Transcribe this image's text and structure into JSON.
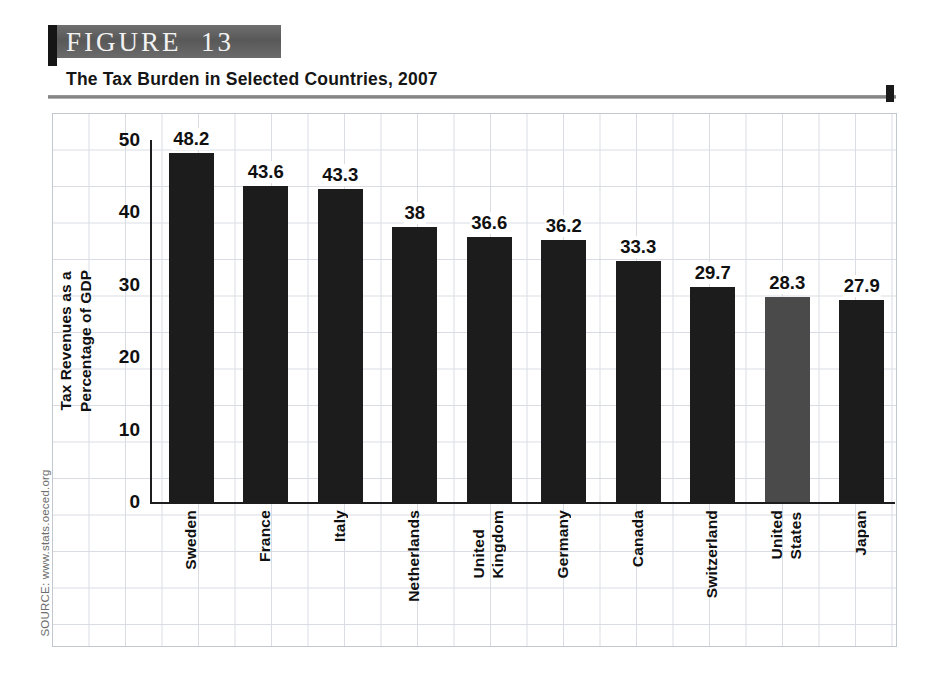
{
  "figure": {
    "banner_label": "FIGURE  13",
    "title": "The Tax Burden in Selected Countries, 2007",
    "source": "SOURCE: www.stats.oeced.org"
  },
  "colors": {
    "bar_default": "#1c1c1c",
    "bar_highlight": "#4a4a4a",
    "grid": "#d9dde3",
    "banner": "#5d5d5d",
    "axis": "#1d1d1d"
  },
  "chart_data": {
    "type": "bar",
    "title": "The Tax Burden in Selected Countries, 2007",
    "xlabel": "",
    "ylabel": "Tax Revenues as a Percentage of GDP",
    "ylabel_line1": "Tax Revenues as a",
    "ylabel_line2": "Percentage of GDP",
    "ylim": [
      0,
      50
    ],
    "yticks": [
      0,
      10,
      20,
      30,
      40,
      50
    ],
    "ytick_labels": [
      "0",
      "10",
      "20",
      "30",
      "40",
      "50"
    ],
    "grid": true,
    "legend": "none",
    "categories": [
      "Sweden",
      "France",
      "Italy",
      "Netherlands",
      "United Kingdom",
      "Germany",
      "Canada",
      "Switzerland",
      "United States",
      "Japan"
    ],
    "category_label_lines": [
      [
        "Sweden"
      ],
      [
        "France"
      ],
      [
        "Italy"
      ],
      [
        "Netherlands"
      ],
      [
        "United",
        "Kingdom"
      ],
      [
        "Germany"
      ],
      [
        "Canada"
      ],
      [
        "Switzerland"
      ],
      [
        "United",
        "States"
      ],
      [
        "Japan"
      ]
    ],
    "values": [
      48.2,
      43.6,
      43.3,
      38,
      36.6,
      36.2,
      33.3,
      29.7,
      28.3,
      27.9
    ],
    "value_labels": [
      "48.2",
      "43.6",
      "43.3",
      "38",
      "36.6",
      "36.2",
      "33.3",
      "29.7",
      "28.3",
      "27.9"
    ],
    "highlighted_category": "United States",
    "bar_colors": [
      "#1c1c1c",
      "#1c1c1c",
      "#1c1c1c",
      "#1c1c1c",
      "#1c1c1c",
      "#1c1c1c",
      "#1c1c1c",
      "#1c1c1c",
      "#4a4a4a",
      "#1c1c1c"
    ]
  }
}
